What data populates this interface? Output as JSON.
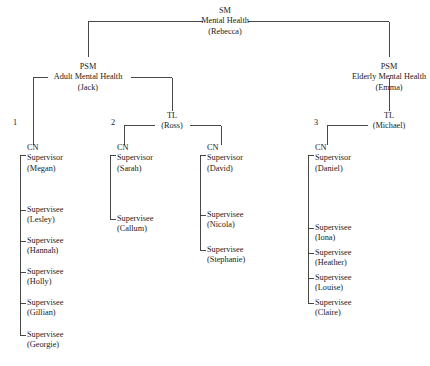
{
  "diagram": {
    "line_color": "#333333",
    "text_color": "#1a1a1a"
  },
  "root": {
    "role": "SM",
    "service": "Mental Health",
    "person": "(Rebecca)"
  },
  "divisions": [
    {
      "id": "adult",
      "role": "PSM",
      "service": "Adult Mental Health",
      "person": "(Jack)"
    },
    {
      "id": "elderly",
      "role": "PSM",
      "service": "Elderly Mental Health",
      "person": "(Emma)"
    }
  ],
  "team_leaders": [
    {
      "id": "ross",
      "role": "TL",
      "person": "(Ross)"
    },
    {
      "id": "michael",
      "role": "TL",
      "person": "(Michael)"
    }
  ],
  "branch_numbers": [
    "1",
    "2",
    "3"
  ],
  "groups": [
    {
      "id": "group-1",
      "number": "1",
      "supervisor": {
        "role": "CN",
        "title": "Supervisor",
        "person": "(Megan)"
      },
      "supervisees": [
        {
          "title": "Supervisee",
          "person": "(Lesley)"
        },
        {
          "title": "Supervisee",
          "person": "(Hannah)"
        },
        {
          "title": "Supervisee",
          "person": "(Holly)"
        },
        {
          "title": "Supervisee",
          "person": "(Gillian)"
        },
        {
          "title": "Supervisee",
          "person": "(Georgie)"
        }
      ]
    },
    {
      "id": "group-2",
      "number": "2",
      "supervisor": {
        "role": "CN",
        "title": "Supervisor",
        "person": "(Sarah)"
      },
      "supervisees": [
        {
          "title": "Supervisee",
          "person": "(Callum)"
        }
      ]
    },
    {
      "id": "group-3",
      "number": "",
      "supervisor": {
        "role": "CN",
        "title": "Supervisor",
        "person": "(David)"
      },
      "supervisees": [
        {
          "title": "Supervisee",
          "person": "(Nicola)"
        },
        {
          "title": "Supervisee",
          "person": "(Stephanie)"
        }
      ]
    },
    {
      "id": "group-4",
      "number": "3",
      "supervisor": {
        "role": "CN",
        "title": "Supervisor",
        "person": "(Daniel)"
      },
      "supervisees": [
        {
          "title": "Supervisee",
          "person": "(Iona)"
        },
        {
          "title": "Supervisee",
          "person": "(Heather)"
        },
        {
          "title": "Supervisee",
          "person": "(Louise)"
        },
        {
          "title": "Supervisee",
          "person": "(Claire)"
        }
      ]
    }
  ]
}
